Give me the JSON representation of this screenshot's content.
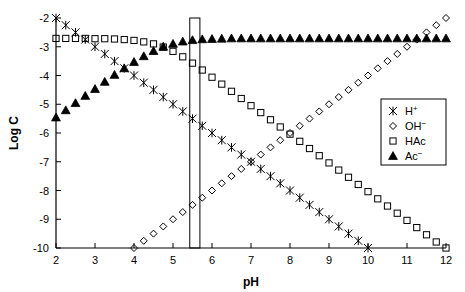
{
  "chart_data": {
    "type": "scatter",
    "title": "",
    "xlabel": "pH",
    "ylabel": "Log C",
    "xlim": [
      2,
      12
    ],
    "ylim": [
      -10,
      -2
    ],
    "xticks": [
      2,
      3,
      4,
      5,
      6,
      7,
      8,
      9,
      10,
      11,
      12
    ],
    "xticklabels": [
      "2",
      "3",
      "4",
      "5",
      "6",
      "7",
      "8",
      "9",
      "10",
      "11",
      "12"
    ],
    "yticks": [
      -2,
      -3,
      -4,
      -5,
      -6,
      -7,
      -8,
      -9,
      -10
    ],
    "yticklabels": [
      "-2",
      "-3",
      "-4",
      "-5",
      "-6",
      "-7",
      "-8",
      "-9",
      "-10"
    ],
    "grid": false,
    "legend_position": "center-right",
    "marker_step": 0.25,
    "annotations": [
      {
        "name": "equivalence-band",
        "type": "vertical-band",
        "x_start": 5.43,
        "x_end": 5.69
      }
    ],
    "series": [
      {
        "name": "H+",
        "label": "H⁺",
        "marker": "star",
        "color": "#000000",
        "filled": false,
        "x": [
          2,
          2.25,
          2.5,
          2.75,
          3,
          3.25,
          3.5,
          3.75,
          4,
          4.25,
          4.5,
          4.75,
          5,
          5.25,
          5.5,
          5.75,
          6,
          6.25,
          6.5,
          6.75,
          7,
          7.25,
          7.5,
          7.75,
          8,
          8.25,
          8.5,
          8.75,
          9,
          9.25,
          9.5,
          9.75,
          10
        ],
        "y": [
          -2,
          -2.25,
          -2.5,
          -2.75,
          -3,
          -3.25,
          -3.5,
          -3.75,
          -4,
          -4.25,
          -4.5,
          -4.75,
          -5,
          -5.25,
          -5.5,
          -5.75,
          -6,
          -6.25,
          -6.5,
          -6.75,
          -7,
          -7.25,
          -7.5,
          -7.75,
          -8,
          -8.25,
          -8.5,
          -8.75,
          -9,
          -9.25,
          -9.5,
          -9.75,
          -10
        ]
      },
      {
        "name": "OH-",
        "label": "OH⁻",
        "marker": "diamond",
        "color": "#000000",
        "filled": false,
        "x": [
          4,
          4.25,
          4.5,
          4.75,
          5,
          5.25,
          5.5,
          5.75,
          6,
          6.25,
          6.5,
          6.75,
          7,
          7.25,
          7.5,
          7.75,
          8,
          8.25,
          8.5,
          8.75,
          9,
          9.25,
          9.5,
          9.75,
          10,
          10.25,
          10.5,
          10.75,
          11,
          11.25,
          11.5,
          11.75,
          12
        ],
        "y": [
          -10,
          -9.75,
          -9.5,
          -9.25,
          -9,
          -8.75,
          -8.5,
          -8.25,
          -8,
          -7.75,
          -7.5,
          -7.25,
          -7,
          -6.75,
          -6.5,
          -6.25,
          -6,
          -5.75,
          -5.5,
          -5.25,
          -5,
          -4.75,
          -4.5,
          -4.25,
          -4,
          -3.75,
          -3.5,
          -3.25,
          -3,
          -2.75,
          -2.5,
          -2.25,
          -2
        ]
      },
      {
        "name": "HAc",
        "label": "HAc",
        "marker": "square",
        "color": "#000000",
        "filled": false,
        "x": [
          2,
          2.25,
          2.5,
          2.75,
          3,
          3.25,
          3.5,
          3.75,
          4,
          4.25,
          4.5,
          4.75,
          5,
          5.25,
          5.5,
          5.75,
          6,
          6.25,
          6.5,
          6.75,
          7,
          7.25,
          7.5,
          7.75,
          8,
          8.25,
          8.5,
          8.75,
          9,
          9.25,
          9.5,
          9.75,
          10,
          10.25,
          10.5,
          10.75,
          11,
          11.25,
          11.5,
          11.75,
          12
        ],
        "y": [
          -2.71,
          -2.71,
          -2.71,
          -2.71,
          -2.72,
          -2.72,
          -2.73,
          -2.75,
          -2.78,
          -2.83,
          -2.9,
          -3.01,
          -3.16,
          -3.35,
          -3.57,
          -3.81,
          -4.06,
          -4.3,
          -4.55,
          -4.8,
          -5.05,
          -5.29,
          -5.54,
          -5.79,
          -6.04,
          -6.29,
          -6.54,
          -6.79,
          -7.04,
          -7.29,
          -7.54,
          -7.79,
          -8.04,
          -8.29,
          -8.54,
          -8.79,
          -9.04,
          -9.29,
          -9.54,
          -9.79,
          -10.0
        ]
      },
      {
        "name": "Ac-",
        "label": "Ac⁻",
        "marker": "triangle",
        "color": "#000000",
        "filled": true,
        "x": [
          2,
          2.25,
          2.5,
          2.75,
          3,
          3.25,
          3.5,
          3.75,
          4,
          4.25,
          4.5,
          4.75,
          5,
          5.25,
          5.5,
          5.75,
          6,
          6.25,
          6.5,
          6.75,
          7,
          7.25,
          7.5,
          7.75,
          8,
          8.25,
          8.5,
          8.75,
          9,
          9.25,
          9.5,
          9.75,
          10,
          10.25,
          10.5,
          10.75,
          11,
          11.25,
          11.5,
          11.75,
          12
        ],
        "y": [
          -5.46,
          -5.21,
          -4.96,
          -4.71,
          -4.47,
          -4.22,
          -3.98,
          -3.75,
          -3.53,
          -3.33,
          -3.15,
          -3.0,
          -2.9,
          -2.82,
          -2.77,
          -2.74,
          -2.73,
          -2.72,
          -2.71,
          -2.71,
          -2.71,
          -2.71,
          -2.71,
          -2.71,
          -2.71,
          -2.71,
          -2.71,
          -2.71,
          -2.71,
          -2.71,
          -2.71,
          -2.71,
          -2.71,
          -2.71,
          -2.71,
          -2.71,
          -2.71,
          -2.71,
          -2.71,
          -2.71,
          -2.71
        ]
      }
    ]
  },
  "legend": {
    "entries": [
      {
        "label": "H",
        "sup": "+",
        "marker": "star"
      },
      {
        "label": "OH",
        "sup": "−",
        "marker": "diamond"
      },
      {
        "label": "HAc",
        "sup": "",
        "marker": "square"
      },
      {
        "label": "Ac",
        "sup": "−",
        "marker": "triangle"
      }
    ]
  },
  "axes": {
    "x_title": "pH",
    "y_title": "Log C"
  }
}
